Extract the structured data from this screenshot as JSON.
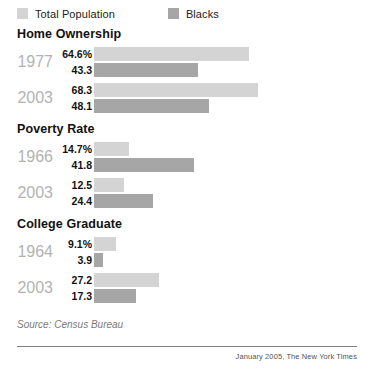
{
  "legend": {
    "items": [
      {
        "label": "Total Population",
        "color": "#d4d4d4",
        "swatch_name": "legend-swatch-total-population"
      },
      {
        "label": "Blacks",
        "color": "#a6a6a6",
        "swatch_name": "legend-swatch-blacks"
      }
    ]
  },
  "sections": [
    {
      "title": "Home Ownership",
      "groups": [
        {
          "year": "1977",
          "rows": [
            {
              "label": "64.6%",
              "value": 64.6,
              "series": "Total Population"
            },
            {
              "label": "43.3",
              "value": 43.3,
              "series": "Blacks"
            }
          ]
        },
        {
          "year": "2003",
          "rows": [
            {
              "label": "68.3",
              "value": 68.3,
              "series": "Total Population"
            },
            {
              "label": "48.1",
              "value": 48.1,
              "series": "Blacks"
            }
          ]
        }
      ]
    },
    {
      "title": "Poverty Rate",
      "groups": [
        {
          "year": "1966",
          "rows": [
            {
              "label": "14.7%",
              "value": 14.7,
              "series": "Total Population"
            },
            {
              "label": "41.8",
              "value": 41.8,
              "series": "Blacks"
            }
          ]
        },
        {
          "year": "2003",
          "rows": [
            {
              "label": "12.5",
              "value": 12.5,
              "series": "Total Population"
            },
            {
              "label": "24.4",
              "value": 24.4,
              "series": "Blacks"
            }
          ]
        }
      ]
    },
    {
      "title": "College Graduate",
      "groups": [
        {
          "year": "1964",
          "rows": [
            {
              "label": "9.1%",
              "value": 9.1,
              "series": "Total Population"
            },
            {
              "label": "3.9",
              "value": 3.9,
              "series": "Blacks"
            }
          ]
        },
        {
          "year": "2003",
          "rows": [
            {
              "label": "27.2",
              "value": 27.2,
              "series": "Total Population"
            },
            {
              "label": "17.3",
              "value": 17.3,
              "series": "Blacks"
            }
          ]
        }
      ]
    }
  ],
  "source": "Source: Census Bureau",
  "credit": "January 2005, The New York Times",
  "chart_data": {
    "type": "bar",
    "title": "",
    "orientation": "horizontal",
    "xlabel": "Percent",
    "ylabel": "",
    "xlim": [
      0,
      70
    ],
    "grid": false,
    "legend_position": "top-left",
    "px_per_unit": 2.4,
    "colors": {
      "total_population": "#d4d4d4",
      "blacks": "#a6a6a6"
    },
    "panels": [
      {
        "name": "Home Ownership",
        "categories": [
          "1977",
          "2003"
        ],
        "series": [
          {
            "name": "Total Population",
            "values": [
              64.6,
              68.3
            ]
          },
          {
            "name": "Blacks",
            "values": [
              43.3,
              48.1
            ]
          }
        ]
      },
      {
        "name": "Poverty Rate",
        "categories": [
          "1966",
          "2003"
        ],
        "series": [
          {
            "name": "Total Population",
            "values": [
              14.7,
              12.5
            ]
          },
          {
            "name": "Blacks",
            "values": [
              41.8,
              24.4
            ]
          }
        ]
      },
      {
        "name": "College Graduate",
        "categories": [
          "1964",
          "2003"
        ],
        "series": [
          {
            "name": "Total Population",
            "values": [
              9.1,
              27.2
            ]
          },
          {
            "name": "Blacks",
            "values": [
              3.9,
              17.3
            ]
          }
        ]
      }
    ],
    "source": "Source: Census Bureau",
    "annotations": [
      "January 2005, The New York Times"
    ]
  }
}
